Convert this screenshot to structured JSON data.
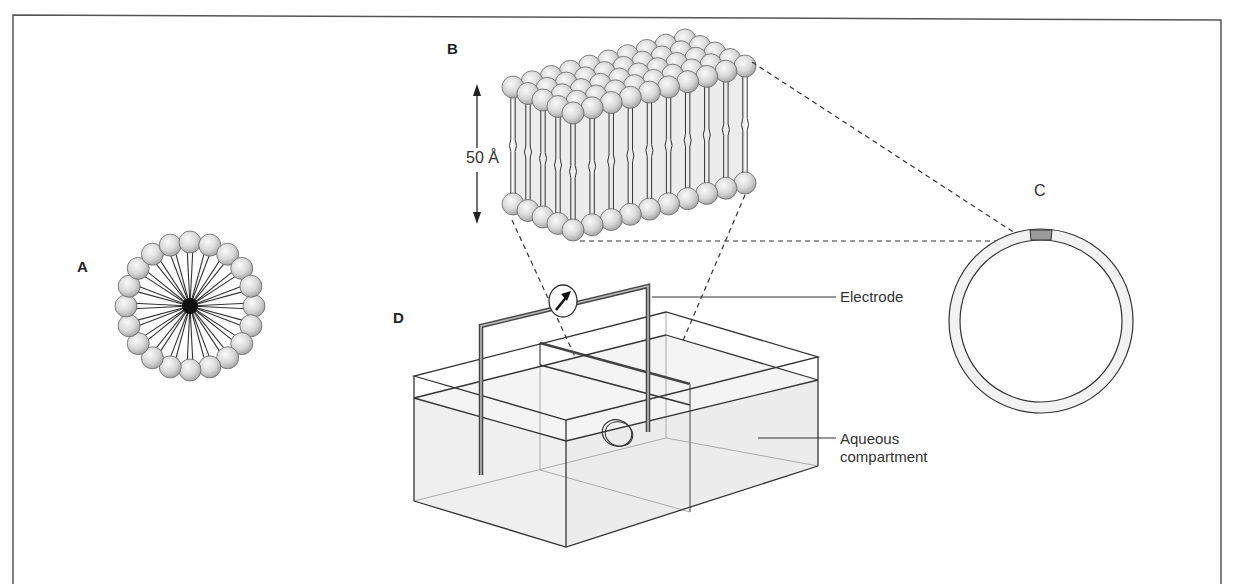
{
  "figure": {
    "panels": {
      "A": {
        "label": "A",
        "description": "Micelle",
        "head_count": 20
      },
      "B": {
        "label": "B",
        "description": "Lipid bilayer segment",
        "dimension_label": "50 Å"
      },
      "C": {
        "label": "C",
        "description": "Liposome / vesicle cross-section"
      },
      "D": {
        "label": "D",
        "description": "Planar bilayer chamber"
      }
    },
    "callouts": {
      "electrode": "Electrode",
      "aqueous_line1": "Aqueous",
      "aqueous_line2": "compartment"
    },
    "colors": {
      "line": "#333333",
      "head_fill": "#d9d9d9",
      "water_fill": "#efefef",
      "membrane_fill": "#ececec",
      "patch_fill": "#9a9a9a"
    }
  }
}
